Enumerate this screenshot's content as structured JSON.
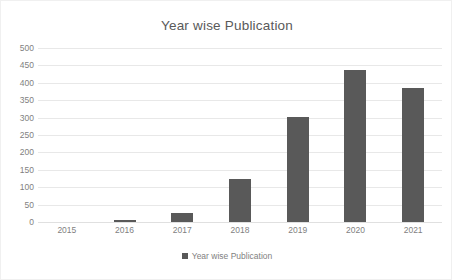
{
  "chart_data": {
    "type": "bar",
    "title": "Year wise Publication",
    "categories": [
      "2015",
      "2016",
      "2017",
      "2018",
      "2019",
      "2020",
      "2021"
    ],
    "values": [
      0,
      5,
      27,
      123,
      302,
      438,
      385
    ],
    "series": [
      {
        "name": "Year wise Publication",
        "values": [
          0,
          5,
          27,
          123,
          302,
          438,
          385
        ]
      }
    ],
    "xlabel": "",
    "ylabel": "",
    "ylim": [
      0,
      500
    ],
    "ytick_step": 50,
    "yticks": [
      "500",
      "450",
      "400",
      "350",
      "300",
      "250",
      "200",
      "150",
      "100",
      "50",
      "0"
    ],
    "grid": true,
    "legend": {
      "position": "bottom",
      "entries": [
        "Year wise Publication"
      ]
    },
    "colors": {
      "bar": "#595959",
      "gridline": "#e8e8e8",
      "title_text": "#595959",
      "tick_text": "#7f7f7f",
      "background": "#ffffff",
      "frame": "#f0f0f0"
    }
  }
}
